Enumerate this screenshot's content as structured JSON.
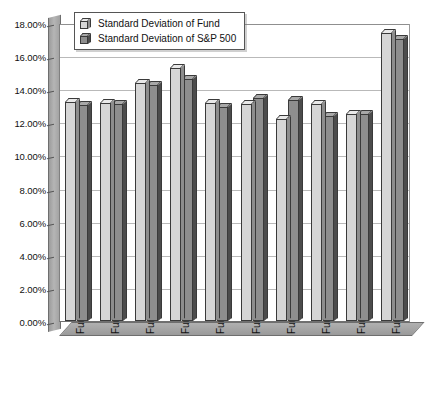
{
  "chart_data": {
    "type": "bar",
    "title": "",
    "xlabel": "",
    "ylabel": "",
    "ylim": [
      0,
      18
    ],
    "grid": true,
    "legend_position": "top-left",
    "ytick_labels": [
      "18.00%",
      "16.00%",
      "14.00%",
      "12.00%",
      "10.00%",
      "8.00%",
      "6.00%",
      "4.00%",
      "2.00%",
      "0.00%"
    ],
    "ytick_values": [
      18,
      16,
      14,
      12,
      10,
      8,
      6,
      4,
      2,
      0
    ],
    "categories": [
      "Fund 1: 6/91–97",
      "Fund 2: 1/91–97",
      "Fund 3: 12/87–97",
      "Fund 4: 1/89–97",
      "Fund 5: 3/91–97",
      "Fund 6: 6/93–97",
      "Fund 7: 7/93–97",
      "Fund 8: 6/92–97",
      "Fund 9: 7/92–97",
      "Fund 10: 1/87–97"
    ],
    "series": [
      {
        "name": "Standard Deviation of Fund",
        "color": "#d6d6d6",
        "values": [
          13.25,
          13.15,
          14.4,
          15.3,
          13.15,
          13.1,
          12.2,
          13.1,
          12.5,
          17.4
        ]
      },
      {
        "name": "Standard Deviation of S&P 500",
        "color": "#8e8e8e",
        "values": [
          13.05,
          13.1,
          14.25,
          14.6,
          12.9,
          13.45,
          13.35,
          12.4,
          12.5,
          17.05
        ]
      }
    ]
  },
  "legend": {
    "items": [
      {
        "label": "Standard Deviation of Fund",
        "swatch": "light"
      },
      {
        "label": "Standard Deviation of S&P 500",
        "swatch": "dark"
      }
    ]
  }
}
